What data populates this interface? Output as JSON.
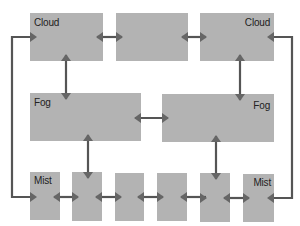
{
  "diagram": {
    "colors": {
      "node_fill": "#b3b3b3",
      "connector": "#555555",
      "background": "#ffffff"
    },
    "nodes": {
      "top_left": {
        "label": "Cloud"
      },
      "top_middle": {
        "label": ""
      },
      "top_right": {
        "label": "Cloud"
      },
      "mid_left": {
        "label": "Fog"
      },
      "mid_right": {
        "label": "Fog"
      },
      "bottom_1": {
        "label": "Mist"
      },
      "bottom_2": {
        "label": ""
      },
      "bottom_3": {
        "label": ""
      },
      "bottom_4": {
        "label": ""
      },
      "bottom_5": {
        "label": ""
      },
      "bottom_6": {
        "label": "Mist"
      }
    },
    "edges": [
      {
        "from": "top_left",
        "to": "top_middle",
        "type": "bidirectional"
      },
      {
        "from": "top_middle",
        "to": "top_right",
        "type": "bidirectional"
      },
      {
        "from": "top_left",
        "to": "mid_left",
        "type": "bidirectional"
      },
      {
        "from": "top_right",
        "to": "mid_right",
        "type": "bidirectional"
      },
      {
        "from": "mid_left",
        "to": "mid_right",
        "type": "bidirectional"
      },
      {
        "from": "mid_left",
        "to": "bottom_2",
        "type": "bidirectional"
      },
      {
        "from": "mid_right",
        "to": "bottom_5",
        "type": "bidirectional"
      },
      {
        "from": "bottom_1",
        "to": "bottom_2",
        "type": "bidirectional"
      },
      {
        "from": "bottom_2",
        "to": "bottom_3",
        "type": "bidirectional"
      },
      {
        "from": "bottom_3",
        "to": "bottom_4",
        "type": "bidirectional"
      },
      {
        "from": "bottom_4",
        "to": "bottom_5",
        "type": "bidirectional"
      },
      {
        "from": "bottom_5",
        "to": "bottom_6",
        "type": "bidirectional"
      },
      {
        "from": "bottom_1",
        "to": "top_left",
        "type": "loop-left"
      },
      {
        "from": "bottom_6",
        "to": "top_right",
        "type": "loop-right"
      }
    ]
  }
}
